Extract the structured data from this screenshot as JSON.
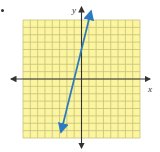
{
  "chart_data": {
    "type": "line",
    "title": "",
    "xlabel": "x",
    "ylabel": "y",
    "xlim": [
      -8,
      8
    ],
    "ylim": [
      -8,
      8
    ],
    "grid": true,
    "grid_step": 1,
    "axis_arrows": true,
    "tick_labels": false,
    "series": [
      {
        "name": "line",
        "equation": "y = 4x + 4",
        "slope": 4,
        "intercept": 4,
        "x": [
          -2.8,
          1.3
        ],
        "y": [
          -7.2,
          9.2
        ],
        "arrows_both_ends": true
      }
    ]
  },
  "colors": {
    "grid_bg": "#FBF5A0",
    "grid_line": "#C8C07A",
    "axis": "#333333",
    "line": "#2B7BC0"
  },
  "labels": {
    "x_axis": "x",
    "y_axis": "y"
  }
}
